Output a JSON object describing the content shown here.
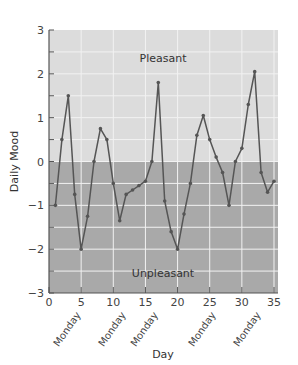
{
  "chart_data": {
    "type": "line",
    "title": "",
    "xlabel": "Day",
    "ylabel": "Daily Mood",
    "xlim": [
      0,
      36
    ],
    "ylim": [
      -3,
      3
    ],
    "x_ticks": [
      0,
      5,
      10,
      15,
      20,
      25,
      30,
      35
    ],
    "y_ticks": [
      -3,
      -2,
      -1,
      0,
      1,
      2,
      3
    ],
    "grid": true,
    "regions": [
      {
        "label": "Pleasant",
        "from": 0,
        "to": 3,
        "color": "#dcdcdc"
      },
      {
        "label": "Unpleasant",
        "from": -3,
        "to": 0,
        "color": "#a9a9a9"
      }
    ],
    "x_annotations": [
      {
        "label": "Monday",
        "x": 5
      },
      {
        "label": "Monday",
        "x": 12
      },
      {
        "label": "Monday",
        "x": 17
      },
      {
        "label": "Monday",
        "x": 26
      },
      {
        "label": "Monday",
        "x": 33
      }
    ],
    "series": [
      {
        "name": "Daily Mood",
        "color": "#555555",
        "x": [
          1,
          2,
          3,
          4,
          5,
          6,
          7,
          8,
          9,
          10,
          11,
          12,
          13,
          14,
          15,
          16,
          17,
          18,
          19,
          20,
          21,
          22,
          23,
          24,
          25,
          26,
          27,
          28,
          29,
          30,
          31,
          32,
          33,
          34,
          35
        ],
        "values": [
          -1.0,
          0.5,
          1.5,
          -0.75,
          -2.0,
          -1.25,
          0.0,
          0.75,
          0.5,
          -0.5,
          -1.35,
          -0.75,
          -0.65,
          -0.55,
          -0.45,
          0.0,
          1.8,
          -0.9,
          -1.6,
          -2.0,
          -1.2,
          -0.5,
          0.6,
          1.05,
          0.5,
          0.1,
          -0.25,
          -1.0,
          0.0,
          0.3,
          1.3,
          2.05,
          -0.25,
          -0.7,
          -0.45
        ]
      }
    ]
  },
  "labels": {
    "pleasant": "Pleasant",
    "unpleasant": "Unpleasant",
    "xlabel": "Day",
    "ylabel": "Daily Mood"
  }
}
